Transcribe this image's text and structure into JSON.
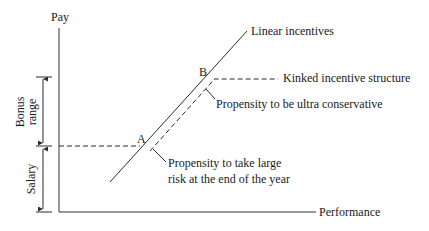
{
  "diagram": {
    "axes": {
      "y_label": "Pay",
      "x_label": "Performance"
    },
    "brackets": {
      "bonus_range": {
        "line1": "Bonus",
        "line2": "range"
      },
      "salary": "Salary"
    },
    "points": {
      "a": "A",
      "b": "B"
    },
    "curves": {
      "linear": "Linear incentives",
      "kinked": "Kinked incentive structure"
    },
    "annotations": {
      "ultra_conservative": "Propensity to be ultra conservative",
      "large_risk_line1": "Propensity to take large",
      "large_risk_line2": "risk at the end of the year"
    },
    "colors": {
      "line": "#2a2a2a",
      "text": "#1a1a1a",
      "background": "#ffffff"
    }
  }
}
